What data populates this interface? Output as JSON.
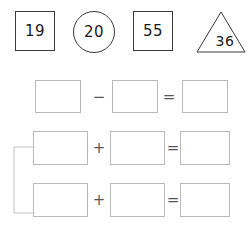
{
  "worksheet": {
    "title": "Number shapes and equation boxes worksheet",
    "width": 251,
    "height": 231,
    "background_color": "#ffffff",
    "shape_stroke_color": "#3a3a3a",
    "box_stroke_color": "#b9b9b9",
    "operator_color": "#555555",
    "number_color": "#1a1a1a"
  },
  "number_shapes": [
    {
      "value": "19",
      "shape": "square",
      "label": "number-shape-square-19"
    },
    {
      "value": "20",
      "shape": "circle",
      "label": "number-shape-circle-20"
    },
    {
      "value": "55",
      "shape": "square",
      "label": "number-shape-square-55"
    },
    {
      "value": "36",
      "shape": "triangle",
      "label": "number-shape-triangle-36"
    }
  ],
  "equations": [
    {
      "id": "equation-row-1",
      "operator": "−",
      "operator_name": "minus",
      "equals": "=",
      "operand_a": "",
      "operand_b": "",
      "result": ""
    },
    {
      "id": "equation-row-2",
      "operator": "+",
      "operator_name": "plus",
      "equals": "=",
      "operand_a": "",
      "operand_b": "",
      "result": ""
    },
    {
      "id": "equation-row-3",
      "operator": "+",
      "operator_name": "plus",
      "equals": "=",
      "operand_a": "",
      "operand_b": "",
      "result": ""
    }
  ],
  "bracket": {
    "name": "grouping-bracket",
    "groups_rows": [
      "equation-row-2",
      "equation-row-3"
    ]
  }
}
